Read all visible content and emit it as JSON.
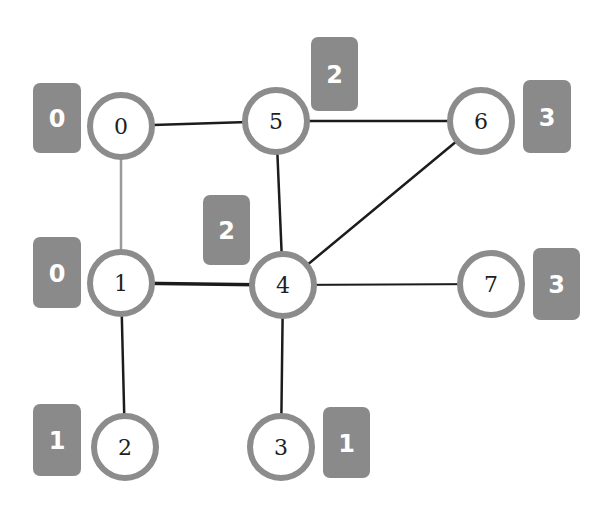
{
  "graph": {
    "colors": {
      "node_stroke": "#8c8c8c",
      "node_fill": "#ffffff",
      "edge_dark": "#1c1c1c",
      "edge_light": "#9a9a9a",
      "badge_fill": "#8a8a8a",
      "badge_text": "#ffffff",
      "label_text": "#1e1e1e"
    },
    "nodes": [
      {
        "id": "0",
        "label": "0",
        "x": 121,
        "y": 126,
        "badge": {
          "label": "0",
          "x": 33,
          "y": 83,
          "w": 48,
          "h": 70
        }
      },
      {
        "id": "1",
        "label": "1",
        "x": 121,
        "y": 283,
        "badge": {
          "label": "0",
          "x": 33,
          "y": 237,
          "w": 48,
          "h": 71
        }
      },
      {
        "id": "2",
        "label": "2",
        "x": 125,
        "y": 447,
        "badge": {
          "label": "1",
          "x": 33,
          "y": 404,
          "w": 48,
          "h": 72
        }
      },
      {
        "id": "3",
        "label": "3",
        "x": 281,
        "y": 447,
        "badge": {
          "label": "1",
          "x": 323,
          "y": 407,
          "w": 47,
          "h": 71
        }
      },
      {
        "id": "4",
        "label": "4",
        "x": 283,
        "y": 285,
        "badge": {
          "label": "2",
          "x": 203,
          "y": 195,
          "w": 47,
          "h": 70
        }
      },
      {
        "id": "5",
        "label": "5",
        "x": 276,
        "y": 121,
        "badge": {
          "label": "2",
          "x": 311,
          "y": 37,
          "w": 47,
          "h": 74
        }
      },
      {
        "id": "6",
        "label": "6",
        "x": 481,
        "y": 121,
        "badge": {
          "label": "3",
          "x": 523,
          "y": 80,
          "w": 48,
          "h": 73
        }
      },
      {
        "id": "7",
        "label": "7",
        "x": 491,
        "y": 284,
        "badge": {
          "label": "3",
          "x": 533,
          "y": 248,
          "w": 47,
          "h": 72
        }
      }
    ],
    "edges": [
      {
        "from": "0",
        "to": "5",
        "style": "dark",
        "width": 2.5
      },
      {
        "from": "0",
        "to": "1",
        "style": "light",
        "width": 2.5
      },
      {
        "from": "5",
        "to": "6",
        "style": "dark",
        "width": 2.5
      },
      {
        "from": "5",
        "to": "4",
        "style": "dark",
        "width": 2.5
      },
      {
        "from": "6",
        "to": "4",
        "style": "dark",
        "width": 2.5
      },
      {
        "from": "1",
        "to": "4",
        "style": "dark",
        "width": 3.5
      },
      {
        "from": "4",
        "to": "7",
        "style": "dark",
        "width": 2
      },
      {
        "from": "1",
        "to": "2",
        "style": "dark",
        "width": 2.5
      },
      {
        "from": "4",
        "to": "3",
        "style": "dark",
        "width": 2.5
      }
    ],
    "node_radius": 31,
    "node_stroke_width": 6
  }
}
